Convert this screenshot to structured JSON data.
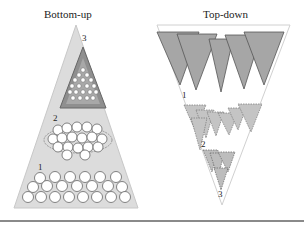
{
  "diagram": {
    "left_panel": {
      "title": "Bottom-up",
      "levels": [
        {
          "label": "1",
          "description": "rows of large circles at base"
        },
        {
          "label": "2",
          "description": "oval clusters of medium circles"
        },
        {
          "label": "3",
          "description": "dark inner triangle containing small circles"
        }
      ]
    },
    "right_panel": {
      "title": "Top-down",
      "levels": [
        {
          "label": "1",
          "description": "row of large dark inverted triangles"
        },
        {
          "label": "2",
          "description": "dashed smaller inverted triangles"
        },
        {
          "label": "3",
          "description": "cluster of smallest inverted triangles at tip"
        }
      ]
    },
    "colors": {
      "outer_shape": "#d9d9d9",
      "inner_dark": "#8c8c8c",
      "triangle_fill": "#a6a6a6",
      "stroke": "#555555",
      "rule": "#8a8a8a"
    }
  }
}
